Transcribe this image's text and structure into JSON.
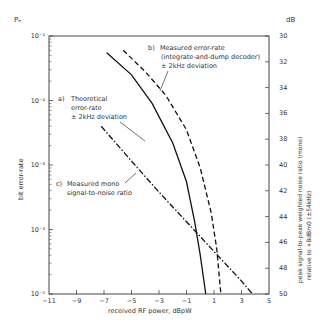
{
  "chart_data": {
    "type": "line",
    "title": "",
    "xlabel": "received RF power, dBpW",
    "ylabel": "bit error-rate",
    "ylabel_top": "Pₑ",
    "y2label_unit": "dB",
    "y2label_line1": "peak signal-to-peak weighted noise ratio (mono)",
    "y2label_line2": "relative to +8dBm0 (±54kHz)",
    "xlim": [
      -11,
      5
    ],
    "ylim": [
      1e-05,
      0.1
    ],
    "yscale": "log",
    "y2lim": [
      50,
      30
    ],
    "x_ticks": [
      "-11",
      "-9",
      "-7",
      "-5",
      "-3",
      "-1",
      "1",
      "3",
      "5"
    ],
    "y_ticks": [
      "10⁻¹",
      "10⁻²",
      "10⁻³",
      "10⁻⁴",
      "10⁻⁵"
    ],
    "y2_ticks": [
      "30",
      "32",
      "34",
      "36",
      "38",
      "40",
      "42",
      "44",
      "46",
      "48",
      "50"
    ],
    "grid": false,
    "series": [
      {
        "name": "a) Theoretical error-rate ±2kHz deviation",
        "style": "solid",
        "axis": "left",
        "x": [
          -6.8,
          -5.0,
          -3.5,
          -2.0,
          -1.0,
          -0.4,
          0.0,
          0.4
        ],
        "y": [
          0.055,
          0.025,
          0.009,
          0.0022,
          0.00055,
          0.00013,
          4e-05,
          1e-05
        ]
      },
      {
        "name": "b) Measured error-rate (integrate-and-dump decoder) ±2kHz deviation",
        "style": "dashed",
        "axis": "left",
        "x": [
          -5.6,
          -4.0,
          -2.5,
          -1.0,
          0.0,
          0.8,
          1.2,
          1.5
        ],
        "y": [
          0.06,
          0.028,
          0.012,
          0.0035,
          0.0009,
          0.00018,
          5e-05,
          1e-05
        ]
      },
      {
        "name": "c) Measured mono signal-to-noise ratio",
        "style": "dashdot",
        "axis": "right",
        "x": [
          -7.2,
          -5.0,
          -3.0,
          -1.0,
          1.0,
          3.0,
          3.8
        ],
        "y2": [
          37.0,
          39.7,
          42.1,
          44.4,
          46.7,
          49.0,
          50.0
        ]
      }
    ],
    "annotations": [
      {
        "label": "a)",
        "lines": [
          "Theoretical",
          "error-rate",
          "± 2kHz deviation"
        ]
      },
      {
        "label": "b)",
        "lines": [
          "Measured error-rate",
          "(integrate-and-dump decoder)",
          "± 2kHz deviation"
        ]
      },
      {
        "label": "c)",
        "lines": [
          "Measured mono",
          "signal-to-noise ratio"
        ]
      }
    ]
  }
}
